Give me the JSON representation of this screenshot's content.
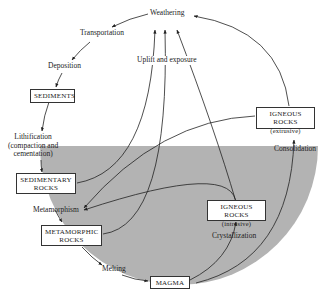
{
  "diagram": {
    "colors": {
      "shade": "#b3b3b3",
      "line": "#222222",
      "background": "#ffffff"
    },
    "boxes": {
      "sediments": "SEDIMENTS",
      "sedimentary_rocks_line1": "SEDIMENTARY",
      "sedimentary_rocks_line2": "ROCKS",
      "metamorphic_rocks_line1": "METAMORPHIC",
      "metamorphic_rocks_line2": "ROCKS",
      "magma": "MAGMA",
      "igneous_intrusive_line1": "IGNEOUS ROCKS",
      "igneous_intrusive_line2": "(intrusive)",
      "igneous_extrusive_line1": "IGNEOUS ROCKS",
      "igneous_extrusive_line2": "(extrusive)"
    },
    "labels": {
      "weathering": "Weathering",
      "transportation": "Transportation",
      "deposition": "Deposition",
      "uplift": "Uplift and exposure",
      "lithification_line1": "Lithification",
      "lithification_line2": "(compaction and",
      "lithification_line3": "cementation)",
      "metamorphism": "Metamorphism",
      "melting": "Melting",
      "crystallization": "Crystallization",
      "consolidation": "Consolidation"
    }
  }
}
